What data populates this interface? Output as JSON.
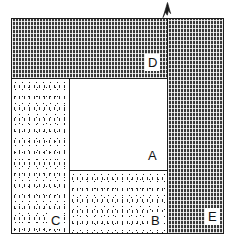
{
  "figure": {
    "background_color": "#ffffff",
    "outline_color": "#1b1b1b"
  },
  "marker": {
    "name": "north-arrow",
    "glyph": "north-arrow-icon",
    "x": 160,
    "y": 1
  },
  "legend": {
    "fills": {
      "blank": "#ffffff",
      "stipple": "#ffffff",
      "dark_hatch": "#3a3a3a"
    }
  },
  "regions": [
    {
      "label": "A",
      "fill": "blank",
      "x": 69,
      "y": 78,
      "width": 99,
      "height": 93,
      "label_x": 148,
      "label_y": 148,
      "label_style": "plain"
    },
    {
      "label": "B",
      "fill": "stipple",
      "x": 69,
      "y": 170,
      "width": 99,
      "height": 64,
      "label_x": 148,
      "label_y": 212,
      "label_style": "boxed"
    },
    {
      "label": "C",
      "fill": "stipple",
      "x": 11,
      "y": 78,
      "width": 59,
      "height": 156,
      "label_x": 48,
      "label_y": 212,
      "label_style": "boxed"
    },
    {
      "label": "D",
      "fill": "dark_hatch",
      "x": 11,
      "y": 18,
      "width": 157,
      "height": 61,
      "label_x": 145,
      "label_y": 54,
      "label_style": "boxed"
    },
    {
      "label": "E",
      "fill": "dark_hatch",
      "x": 167,
      "y": 18,
      "width": 57,
      "height": 216,
      "label_x": 205,
      "label_y": 208,
      "label_style": "boxed"
    }
  ]
}
